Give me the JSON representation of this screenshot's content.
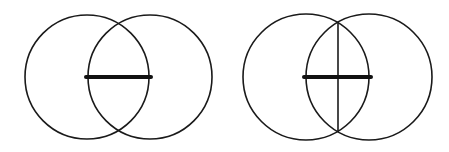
{
  "diagram": {
    "colors": {
      "stroke": "#1a1a1a",
      "background": "#ffffff"
    },
    "figures": [
      {
        "name": "figure-1",
        "circles": [
          {
            "cx": 87,
            "cy": 77,
            "r": 62
          },
          {
            "cx": 150,
            "cy": 77,
            "r": 62
          }
        ],
        "segment": {
          "x1": 86,
          "y1": 77,
          "x2": 151,
          "y2": 77
        },
        "bisector": null
      },
      {
        "name": "figure-2",
        "circles": [
          {
            "cx": 306,
            "cy": 77,
            "r": 63
          },
          {
            "cx": 369,
            "cy": 77,
            "r": 63
          }
        ],
        "segment": {
          "x1": 304,
          "y1": 77,
          "x2": 371,
          "y2": 77
        },
        "bisector": {
          "x1": 338,
          "y1": 22,
          "x2": 338,
          "y2": 132
        }
      }
    ]
  }
}
